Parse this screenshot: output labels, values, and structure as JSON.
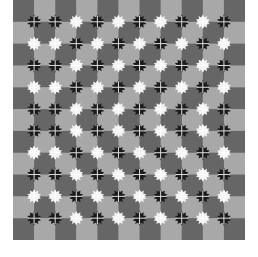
{
  "illusion": {
    "grid_cols": 11,
    "grid_rows": 11,
    "colors": {
      "dark_square": "#666666",
      "light_square": "#a8a8a8",
      "dark_flower": "#1a1a1a",
      "light_flower": "#f4f4f4",
      "background": "#ffffff"
    },
    "first_square": "dark",
    "flower_rows": [
      "BBWBWBWBWB",
      "WWBWBWBWBW",
      "BBWBWBWBWB",
      "WWBWBWBWBW",
      "BBWBWBWBWB",
      "BBWBWBWBWB",
      "WWBWBWBWBW",
      "BBWBWBWBWB",
      "WWBWBWBWBW",
      "BBWBWBWBWB"
    ]
  }
}
